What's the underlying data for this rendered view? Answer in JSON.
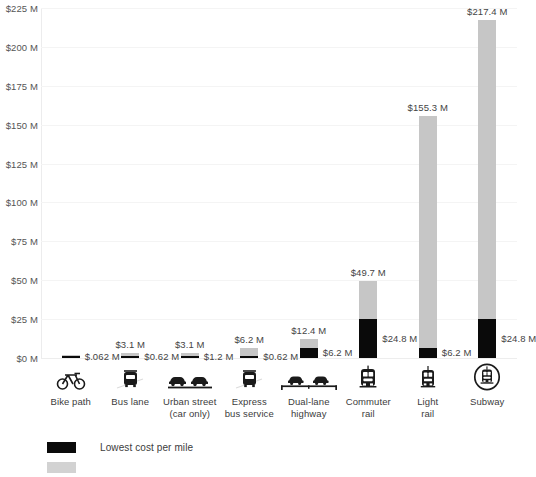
{
  "chart_data": {
    "type": "bar",
    "title": "",
    "subtitle": "",
    "xlabel": "",
    "ylabel": "",
    "ylim": [
      0,
      225
    ],
    "ytick_labels": [
      "$225 M",
      "$200 M",
      "$175 M",
      "$150 M",
      "$125 M",
      "$100 M",
      "$75 M",
      "$50 M",
      "$25 M",
      "$0 M"
    ],
    "ytick_values": [
      225,
      200,
      175,
      150,
      125,
      100,
      75,
      50,
      25,
      0
    ],
    "grid": true,
    "legend_position": "bottom-left",
    "categories": [
      "Bike path",
      "Bus lane",
      "Urban street (car only)",
      "Express bus service",
      "Dual-lane highway",
      "Commuter rail",
      "Light rail",
      "Subway"
    ],
    "category_lines": [
      [
        "Bike path"
      ],
      [
        "Bus lane"
      ],
      [
        "Urban street",
        "(car only)"
      ],
      [
        "Express",
        "bus service"
      ],
      [
        "Dual-lane",
        "highway"
      ],
      [
        "Commuter",
        "rail"
      ],
      [
        "Light",
        "rail"
      ],
      [
        "Subway"
      ]
    ],
    "category_icons": [
      "bicycle-icon",
      "bus-icon",
      "two-cars-icon",
      "bus-icon",
      "highway-cars-icon",
      "commuter-train-icon",
      "light-rail-train-icon",
      "subway-train-circle-icon"
    ],
    "series": [
      {
        "name": "Lowest cost per mile",
        "color": "#0a0a0a",
        "values": [
          0.062,
          0.62,
          1.2,
          0.62,
          6.2,
          24.8,
          6.2,
          24.8
        ],
        "labels": [
          "$.062 M",
          "$0.62 M",
          "$1.2 M",
          "$0.62 M",
          "$6.2 M",
          "$24.8 M",
          "$6.2 M",
          "$24.8 M"
        ]
      },
      {
        "name": "Highest cost per mile",
        "color": "#c6c6c6",
        "values": [
          0.062,
          3.1,
          3.1,
          6.2,
          12.4,
          49.7,
          155.3,
          217.4
        ],
        "labels": [
          "",
          "$3.1 M",
          "$3.1 M",
          "$6.2 M",
          "$12.4 M",
          "$49.7 M",
          "$155.3 M",
          "$217.4 M"
        ]
      }
    ]
  },
  "legend": {
    "rows": [
      {
        "label": "Lowest cost per mile",
        "swatch": "low"
      },
      {
        "label": "",
        "swatch": "high"
      }
    ]
  }
}
